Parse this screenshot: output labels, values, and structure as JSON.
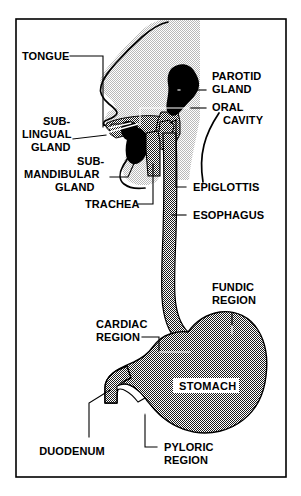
{
  "figure": {
    "frame_border_color": "#000000",
    "background_color": "#ffffff"
  },
  "colors": {
    "head_fill": "#e2e2e2",
    "stomach_fill": "#8a8a8a",
    "tongue_fill": "#8a8a8a",
    "gland_fill": "#000000",
    "outline": "#000000",
    "label_text": "#000000",
    "stomach_label_bg": "#ffffff"
  },
  "labels": {
    "tongue": {
      "text": "TONGUE",
      "lines": [
        "TONGUE"
      ],
      "side": "left"
    },
    "sublingual_gland": {
      "text": "SUB-LINGUAL GLAND",
      "lines": [
        "SUB-",
        "LINGUAL",
        "GLAND"
      ],
      "side": "left"
    },
    "submandibular_gland": {
      "text": "SUB-MANDIBULAR GLAND",
      "lines": [
        "SUB-",
        "MANDIBULAR",
        "GLAND"
      ],
      "side": "left"
    },
    "trachea": {
      "text": "TRACHEA",
      "lines": [
        "TRACHEA"
      ],
      "side": "left"
    },
    "parotid_gland": {
      "text": "PAROTID GLAND",
      "lines": [
        "PAROTID",
        "GLAND"
      ],
      "side": "right"
    },
    "oral_cavity": {
      "text": "ORAL CAVITY",
      "lines": [
        "ORAL",
        "CAVITY"
      ],
      "side": "right"
    },
    "epiglottis": {
      "text": "EPIGLOTTIS",
      "lines": [
        "EPIGLOTTIS"
      ],
      "side": "right"
    },
    "esophagus": {
      "text": "ESOPHAGUS",
      "lines": [
        "ESOPHAGUS"
      ],
      "side": "right"
    },
    "fundic_region": {
      "text": "FUNDIC REGION",
      "lines": [
        "FUNDIC",
        "REGION"
      ],
      "side": "right"
    },
    "cardiac_region": {
      "text": "CARDIAC REGION",
      "lines": [
        "CARDIAC",
        "REGION"
      ],
      "side": "left"
    },
    "stomach": {
      "text": "STOMACH",
      "lines": [
        "STOMACH"
      ],
      "side": "center"
    },
    "duodenum": {
      "text": "DUODENUM",
      "lines": [
        "DUODENUM"
      ],
      "side": "left"
    },
    "pyloric_region": {
      "text": "PYLORIC REGION",
      "lines": [
        "PYLORIC",
        "REGION"
      ],
      "side": "right"
    }
  }
}
